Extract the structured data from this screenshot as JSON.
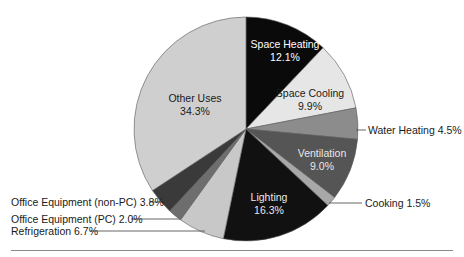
{
  "chart_data": {
    "type": "pie",
    "title": "",
    "start_angle_deg": 0,
    "direction": "clockwise",
    "slices": [
      {
        "label": "Space Heating",
        "value": 12.1,
        "display": "12.1%",
        "color": "#0a0a0a",
        "label_color": "#ffffff",
        "label_position": "inside"
      },
      {
        "label": "Space Cooling",
        "value": 9.9,
        "display": "9.9%",
        "color": "#e6e6e6",
        "label_color": "#1a1a1a",
        "label_position": "inside"
      },
      {
        "label": "Water Heating",
        "value": 4.5,
        "display": "4.5%",
        "color": "#8c8c8c",
        "label_color": "#1a1a1a",
        "label_position": "outside"
      },
      {
        "label": "Ventilation",
        "value": 9.0,
        "display": "9.0%",
        "color": "#555555",
        "label_color": "#e8e8e8",
        "label_position": "inside"
      },
      {
        "label": "Cooking",
        "value": 1.5,
        "display": "1.5%",
        "color": "#a8a8a8",
        "label_color": "#1a1a1a",
        "label_position": "outside"
      },
      {
        "label": "Lighting",
        "value": 16.3,
        "display": "16.3%",
        "color": "#111111",
        "label_color": "#e8e8e8",
        "label_position": "inside"
      },
      {
        "label": "Refrigeration",
        "value": 6.7,
        "display": "6.7%",
        "color": "#c8c8c8",
        "label_color": "#1a1a1a",
        "label_position": "outside"
      },
      {
        "label": "Office Equipment (PC)",
        "value": 2.0,
        "display": "2.0%",
        "color": "#6e6e6e",
        "label_color": "#1a1a1a",
        "label_position": "outside"
      },
      {
        "label": "Office Equipment (non-PC)",
        "value": 3.8,
        "display": "3.8%",
        "color": "#3a3a3a",
        "label_color": "#1a1a1a",
        "label_position": "outside"
      },
      {
        "label": "Other Uses",
        "value": 34.3,
        "display": "34.3%",
        "color": "#cfcfcf",
        "label_color": "#1a1a1a",
        "label_position": "inside"
      }
    ],
    "legend": "none (callout labels)"
  },
  "labels": {
    "space_heating": {
      "name": "Space Heating",
      "pct": "12.1%"
    },
    "space_cooling": {
      "name": "Space Cooling",
      "pct": "9.9%"
    },
    "water_heating": "Water Heating 4.5%",
    "ventilation": {
      "name": "Ventilation",
      "pct": "9.0%"
    },
    "cooking": "Cooking 1.5%",
    "lighting": {
      "name": "Lighting",
      "pct": "16.3%"
    },
    "refrigeration": "Refrigeration 6.7%",
    "office_pc": "Office Equipment (PC) 2.0%",
    "office_non_pc": "Office Equipment (non-PC) 3.8%",
    "other_uses": {
      "name": "Other Uses",
      "pct": "34.3%"
    }
  }
}
